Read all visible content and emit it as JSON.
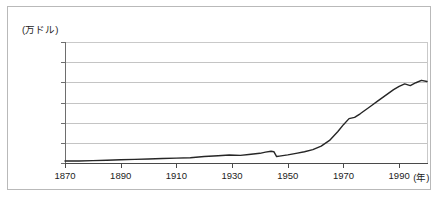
{
  "chart_data": {
    "type": "line",
    "title": "",
    "subtitle": "",
    "xlabel": "(年)",
    "ylabel": "(万ドル)",
    "ylim": [
      0.0,
      3.0
    ],
    "xlim": [
      1870,
      2000
    ],
    "grid": "horizontal",
    "legend": "none",
    "y_ticks": [
      "3.0",
      "2.5",
      "2.0",
      "1.5",
      "1.0",
      "0.5",
      "0.0"
    ],
    "y_tick_values": [
      3.0,
      2.5,
      2.0,
      1.5,
      1.0,
      0.5,
      0.0
    ],
    "x_ticks": [
      "1870",
      "1890",
      "1910",
      "1930",
      "1950",
      "1970",
      "1990"
    ],
    "x_tick_values": [
      1870,
      1890,
      1910,
      1930,
      1950,
      1970,
      1990
    ],
    "line_color": "#262626",
    "grid_color": "#c4c4c4",
    "series": [
      {
        "name": "",
        "x": [
          1870,
          1875,
          1880,
          1885,
          1890,
          1895,
          1900,
          1905,
          1910,
          1915,
          1920,
          1925,
          1929,
          1933,
          1936,
          1940,
          1942,
          1944,
          1945,
          1946,
          1947,
          1950,
          1953,
          1956,
          1959,
          1962,
          1965,
          1968,
          1970,
          1972,
          1974,
          1976,
          1978,
          1980,
          1982,
          1984,
          1986,
          1988,
          1990,
          1992,
          1994,
          1996,
          1998,
          2000
        ],
        "values": [
          0.05,
          0.05,
          0.06,
          0.07,
          0.08,
          0.09,
          0.1,
          0.11,
          0.12,
          0.13,
          0.16,
          0.18,
          0.2,
          0.19,
          0.21,
          0.24,
          0.27,
          0.29,
          0.28,
          0.16,
          0.17,
          0.2,
          0.24,
          0.28,
          0.33,
          0.42,
          0.56,
          0.78,
          0.95,
          1.1,
          1.13,
          1.22,
          1.32,
          1.42,
          1.52,
          1.62,
          1.72,
          1.82,
          1.9,
          1.96,
          1.92,
          1.99,
          2.05,
          2.02
        ]
      }
    ]
  }
}
